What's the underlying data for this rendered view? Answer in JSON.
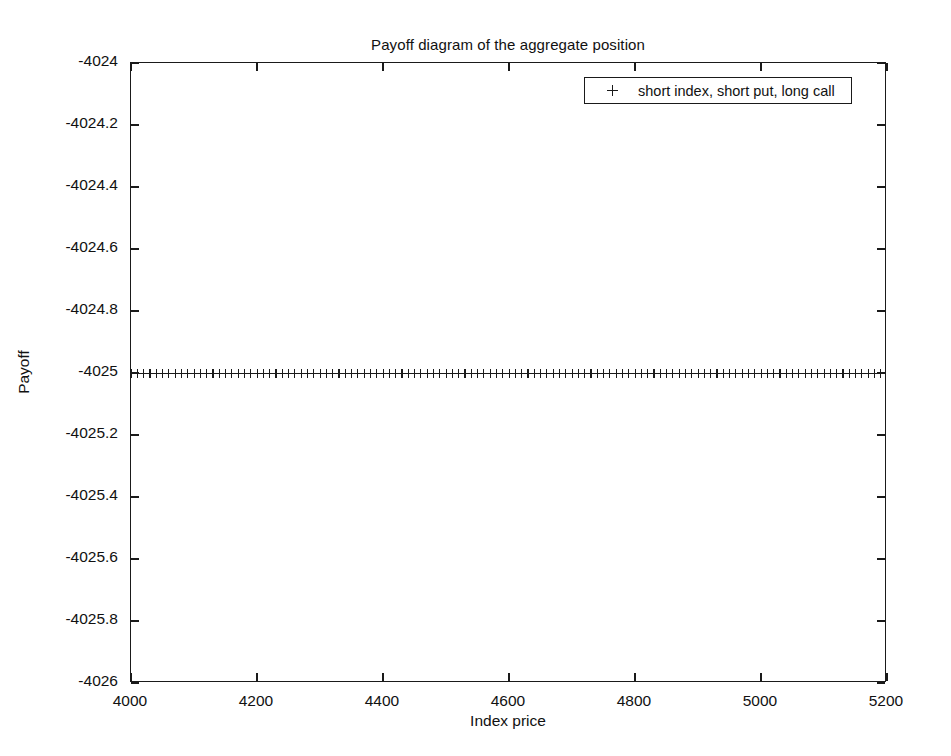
{
  "chart_data": {
    "type": "line",
    "title": "Payoff diagram of the aggregate position",
    "xlabel": "Index price",
    "ylabel": "Payoff",
    "xlim": [
      4000,
      5200
    ],
    "ylim": [
      -4026,
      -4024
    ],
    "xticks": [
      "4000",
      "4200",
      "4400",
      "4600",
      "4800",
      "5000",
      "5200"
    ],
    "xtick_values": [
      4000,
      4200,
      4400,
      4600,
      4800,
      5000,
      5200
    ],
    "yticks": [
      "-4026",
      "-4025.8",
      "-4025.6",
      "-4025.4",
      "-4025.2",
      "-4025",
      "-4024.8",
      "-4024.6",
      "-4024.4",
      "-4024.2",
      "-4024"
    ],
    "ytick_values": [
      -4026,
      -4025.8,
      -4025.6,
      -4025.4,
      -4025.2,
      -4025,
      -4024.8,
      -4024.6,
      -4024.4,
      -4024.2,
      -4024
    ],
    "grid": false,
    "legend_position": "top-right",
    "marker": "+",
    "line_color": "#1a1a1a",
    "series": [
      {
        "name": "short index, short put, long call",
        "marker": "+",
        "constant_value": -4025,
        "x": [
          4000,
          4010,
          4020,
          4030,
          4040,
          4050,
          4060,
          4070,
          4080,
          4090,
          4100,
          4110,
          4120,
          4130,
          4140,
          4150,
          4160,
          4170,
          4180,
          4190,
          4200,
          4210,
          4220,
          4230,
          4240,
          4250,
          4260,
          4270,
          4280,
          4290,
          4300,
          4310,
          4320,
          4330,
          4340,
          4350,
          4360,
          4370,
          4380,
          4390,
          4400,
          4410,
          4420,
          4430,
          4440,
          4450,
          4460,
          4470,
          4480,
          4490,
          4500,
          4510,
          4520,
          4530,
          4540,
          4550,
          4560,
          4570,
          4580,
          4590,
          4600,
          4610,
          4620,
          4630,
          4640,
          4650,
          4660,
          4670,
          4680,
          4690,
          4700,
          4710,
          4720,
          4730,
          4740,
          4750,
          4760,
          4770,
          4780,
          4790,
          4800,
          4810,
          4820,
          4830,
          4840,
          4850,
          4860,
          4870,
          4880,
          4890,
          4900,
          4910,
          4920,
          4930,
          4940,
          4950,
          4960,
          4970,
          4980,
          4990,
          5000,
          5010,
          5020,
          5030,
          5040,
          5050,
          5060,
          5070,
          5080,
          5090,
          5100,
          5110,
          5120,
          5130,
          5140,
          5150,
          5160,
          5170,
          5180,
          5190,
          5200
        ],
        "values": [
          -4025,
          -4025,
          -4025,
          -4025,
          -4025,
          -4025,
          -4025,
          -4025,
          -4025,
          -4025,
          -4025,
          -4025,
          -4025,
          -4025,
          -4025,
          -4025,
          -4025,
          -4025,
          -4025,
          -4025,
          -4025,
          -4025,
          -4025,
          -4025,
          -4025,
          -4025,
          -4025,
          -4025,
          -4025,
          -4025,
          -4025,
          -4025,
          -4025,
          -4025,
          -4025,
          -4025,
          -4025,
          -4025,
          -4025,
          -4025,
          -4025,
          -4025,
          -4025,
          -4025,
          -4025,
          -4025,
          -4025,
          -4025,
          -4025,
          -4025,
          -4025,
          -4025,
          -4025,
          -4025,
          -4025,
          -4025,
          -4025,
          -4025,
          -4025,
          -4025,
          -4025,
          -4025,
          -4025,
          -4025,
          -4025,
          -4025,
          -4025,
          -4025,
          -4025,
          -4025,
          -4025,
          -4025,
          -4025,
          -4025,
          -4025,
          -4025,
          -4025,
          -4025,
          -4025,
          -4025,
          -4025,
          -4025,
          -4025,
          -4025,
          -4025,
          -4025,
          -4025,
          -4025,
          -4025,
          -4025,
          -4025,
          -4025,
          -4025,
          -4025,
          -4025,
          -4025,
          -4025,
          -4025,
          -4025,
          -4025,
          -4025,
          -4025,
          -4025,
          -4025,
          -4025,
          -4025,
          -4025,
          -4025,
          -4025,
          -4025,
          -4025,
          -4025,
          -4025,
          -4025,
          -4025,
          -4025,
          -4025,
          -4025,
          -4025,
          -4025,
          -4025
        ]
      }
    ]
  },
  "legend": {
    "marker_symbol": "+",
    "entry_label": "short index, short put, long call"
  }
}
